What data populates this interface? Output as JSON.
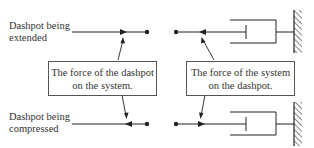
{
  "labels": {
    "extended_line1": "Dashpot being",
    "extended_line2": "extended",
    "compressed_line1": "Dashpot being",
    "compressed_line2": "compressed"
  },
  "boxes": {
    "left_line1": "The force of the dashpot",
    "left_line2": "on the system.",
    "right_line1": "The force of the system",
    "right_line2": "on the dashpot."
  },
  "colors": {
    "line": "#222222",
    "box_border": "#555555",
    "background": "#ffffff"
  }
}
